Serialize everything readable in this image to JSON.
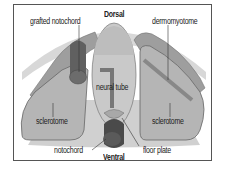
{
  "diagram": {
    "orientation_labels": {
      "top": "Dorsal",
      "bottom": "Ventral"
    },
    "labels": {
      "grafted_notochord": "grafted notochord",
      "dermomyotome": "dermomyotome",
      "neural_tube": "neural tube",
      "sclerotome_left": "sclerotome",
      "sclerotome_right": "sclerotome",
      "notochord": "notochord",
      "floor_plate": "floor plate"
    },
    "colors": {
      "ectoderm": "#d4d4d4",
      "mesoderm": "#bdbdbd",
      "dermomyotome": "#9a9a9a",
      "sclerotome": "#b8b8b8",
      "neural_tube": "#c8c8c8",
      "notochord": "#555555",
      "floor_plate": "#a8a8a8",
      "outline": "#666666"
    }
  }
}
